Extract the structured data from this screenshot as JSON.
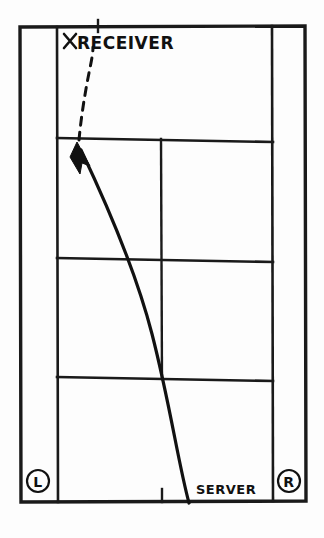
{
  "diagram": {
    "kind": "hand-drawn tennis court plan view",
    "labels": {
      "receiver": "RECEIVER",
      "receiver_marker": "x-mark-icon",
      "server": "SERVER",
      "left_box": "L",
      "right_box": "R"
    },
    "annotations": {
      "receiver_marker_position": "top-left service box area",
      "server_position": "bottom right of baseline",
      "ball_path_style_outbound": "solid",
      "ball_path_style_return": "dashed",
      "arrow_direction": "up-left toward receiver"
    },
    "court": {
      "outer_boundary": {
        "x": 20,
        "y": 26,
        "width": 286,
        "height": 476
      },
      "singles_sideline_left_x": 57,
      "singles_sideline_right_x": 272,
      "service_line_near_y": 138,
      "net_y": 258,
      "service_line_far_y": 378,
      "center_service_line_x": 161,
      "center_mark_top_x": 98,
      "center_mark_bottom_x": 162,
      "line_color": "#1a1a1a",
      "background_color": "#fdfdfd"
    },
    "trajectory": {
      "solid_path": "M 188 502 C 176 460 168 400 150 330 C 132 260 100 190 80 148",
      "dashed_path": "M 78 142 C 80 120 84 92 89 68 C 91 58 92 52 92 48",
      "arrow_tip": {
        "x": 78,
        "y": 144
      }
    }
  }
}
